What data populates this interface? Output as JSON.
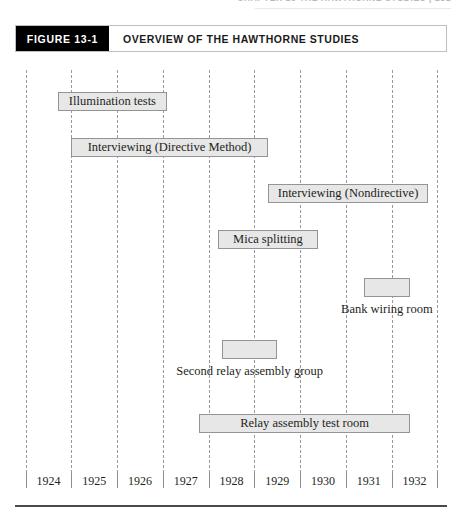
{
  "page_header": {
    "text": "CHAPTER 13   THE HAWTHORNE STUDIES | 281"
  },
  "figure": {
    "tag": "FIGURE 13-1",
    "title": "OVERVIEW OF THE HAWTHORNE STUDIES"
  },
  "chart_data": {
    "type": "bar",
    "orientation": "horizontal",
    "title": "Overview of the Hawthorne Studies",
    "xlabel": "",
    "ylabel": "",
    "xlim": [
      1924,
      1933
    ],
    "grid": true,
    "legend": "none",
    "tick_labels": [
      "1924",
      "1925",
      "1926",
      "1927",
      "1928",
      "1929",
      "1930",
      "1931",
      "1932"
    ],
    "categories": [
      "Illumination tests",
      "Interviewing (Directive Method)",
      "Interviewing (Nondirective)",
      "Mica splitting",
      "Bank wiring room",
      "Second relay assembly group",
      "Relay assembly test room"
    ],
    "bars": [
      {
        "label": "Illumination tests",
        "start": 1924.7,
        "end": 1927.1,
        "label_position": "inside",
        "row": 0
      },
      {
        "label": "Interviewing (Directive Method)",
        "start": 1925.0,
        "end": 1929.3,
        "label_position": "inside",
        "row": 1
      },
      {
        "label": "Interviewing (Nondirective)",
        "start": 1929.3,
        "end": 1932.8,
        "label_position": "inside",
        "row": 2
      },
      {
        "label": "Mica splitting",
        "start": 1928.2,
        "end": 1930.4,
        "label_position": "inside",
        "row": 3
      },
      {
        "label": "Bank wiring room",
        "start": 1931.4,
        "end": 1932.4,
        "label_position": "below",
        "row": 4
      },
      {
        "label": "Second relay assembly group",
        "start": 1928.3,
        "end": 1929.5,
        "label_position": "below",
        "row": 5
      },
      {
        "label": "Relay assembly test room",
        "start": 1927.8,
        "end": 1932.4,
        "label_position": "inside",
        "row": 6
      }
    ]
  },
  "colors": {
    "bar_fill": "#e7e7e7",
    "bar_border": "#949494",
    "gridline": "#9a9a9e",
    "tag_background": "#000000",
    "tag_text": "#ffffff",
    "text": "#231f20"
  }
}
